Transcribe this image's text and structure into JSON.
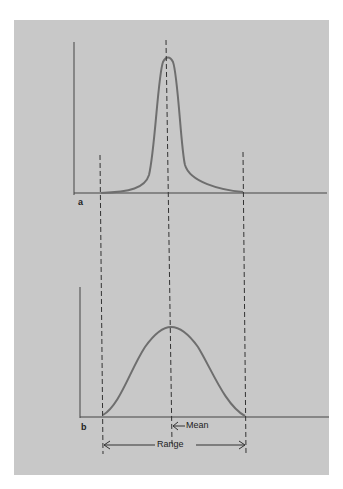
{
  "panels": [
    {
      "id": "a",
      "label": "a",
      "description": "narrow tall distribution"
    },
    {
      "id": "b",
      "label": "b",
      "description": "wide flat distribution"
    }
  ],
  "annotations": {
    "mean": "Mean",
    "range": "Range"
  },
  "colors": {
    "background": "#c8c8c8",
    "curve": "#6e6e6e",
    "axis": "#444444"
  }
}
